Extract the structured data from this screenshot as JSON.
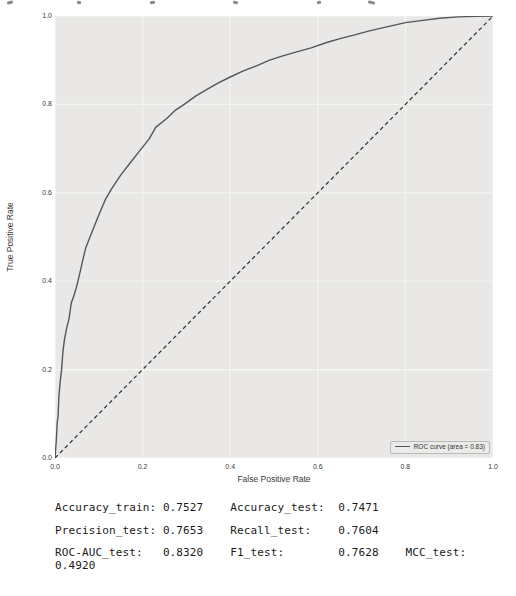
{
  "figure": {
    "plot_bg": "#e9e8e6",
    "grid_color": "#f6f6f4",
    "curve_color": "#54565a",
    "diagonal_color": "#2e2e2e",
    "legend_bg": "#ebebe9",
    "legend_border": "#b9b9b9",
    "tick_text_color": "#3a3a3a"
  },
  "top_remnants": [
    [
      7,
      6
    ],
    [
      77,
      4
    ],
    [
      150,
      5
    ],
    [
      233,
      5
    ],
    [
      317,
      4
    ],
    [
      368,
      7
    ]
  ],
  "chart_data": {
    "type": "line",
    "title": "",
    "xlabel": "False Positive Rate",
    "ylabel": "True Positive Rate",
    "xlim": [
      0.0,
      1.0
    ],
    "ylim": [
      0.0,
      1.0
    ],
    "xticks": [
      "0.0",
      "0.2",
      "0.4",
      "0.6",
      "0.8",
      "1.0"
    ],
    "yticks": [
      "0.0",
      "0.2",
      "0.4",
      "0.6",
      "0.8",
      "1.0"
    ],
    "grid": true,
    "legend": {
      "position": "lower right",
      "label": "ROC curve (area = 0.83)"
    },
    "auc": 0.83,
    "series": [
      {
        "name": "roc-curve",
        "style": "solid",
        "color": "#54565a",
        "points": [
          [
            0,
            0
          ],
          [
            0.003,
            0.04
          ],
          [
            0.005,
            0.08
          ],
          [
            0.007,
            0.095
          ],
          [
            0.009,
            0.14
          ],
          [
            0.012,
            0.175
          ],
          [
            0.015,
            0.2
          ],
          [
            0.018,
            0.24
          ],
          [
            0.022,
            0.27
          ],
          [
            0.027,
            0.295
          ],
          [
            0.032,
            0.315
          ],
          [
            0.037,
            0.35
          ],
          [
            0.044,
            0.37
          ],
          [
            0.05,
            0.39
          ],
          [
            0.057,
            0.42
          ],
          [
            0.064,
            0.45
          ],
          [
            0.07,
            0.475
          ],
          [
            0.08,
            0.5
          ],
          [
            0.09,
            0.525
          ],
          [
            0.1,
            0.55
          ],
          [
            0.115,
            0.585
          ],
          [
            0.13,
            0.61
          ],
          [
            0.15,
            0.64
          ],
          [
            0.172,
            0.668
          ],
          [
            0.195,
            0.697
          ],
          [
            0.215,
            0.722
          ],
          [
            0.23,
            0.748
          ],
          [
            0.255,
            0.768
          ],
          [
            0.275,
            0.787
          ],
          [
            0.295,
            0.8
          ],
          [
            0.32,
            0.818
          ],
          [
            0.345,
            0.833
          ],
          [
            0.372,
            0.848
          ],
          [
            0.4,
            0.862
          ],
          [
            0.43,
            0.876
          ],
          [
            0.46,
            0.887
          ],
          [
            0.49,
            0.9
          ],
          [
            0.52,
            0.91
          ],
          [
            0.55,
            0.918
          ],
          [
            0.585,
            0.928
          ],
          [
            0.62,
            0.94
          ],
          [
            0.655,
            0.95
          ],
          [
            0.68,
            0.956
          ],
          [
            0.72,
            0.967
          ],
          [
            0.76,
            0.976
          ],
          [
            0.8,
            0.985
          ],
          [
            0.84,
            0.99
          ],
          [
            0.878,
            0.995
          ],
          [
            0.92,
            0.998
          ],
          [
            0.96,
            0.999
          ],
          [
            1,
            1
          ]
        ]
      },
      {
        "name": "chance-diagonal",
        "style": "dashed",
        "color": "#2e2e2e",
        "points": [
          [
            0,
            0
          ],
          [
            1,
            1
          ]
        ]
      }
    ]
  },
  "metrics": {
    "values": {
      "Accuracy_train": "0.7527",
      "Accuracy_test": "0.7471",
      "Precision_test": "0.7653",
      "Recall_test": "0.7604",
      "ROC_AUC_test": "0.8320",
      "F1_test": "0.7628",
      "MCC_test": "0.4920"
    },
    "lines": [
      "Accuracy_train: 0.7527    Accuracy_test:  0.7471",
      "Precision_test: 0.7653    Recall_test:    0.7604",
      "ROC-AUC_test:   0.8320    F1_test:        0.7628    MCC_test:\n0.4920"
    ]
  }
}
